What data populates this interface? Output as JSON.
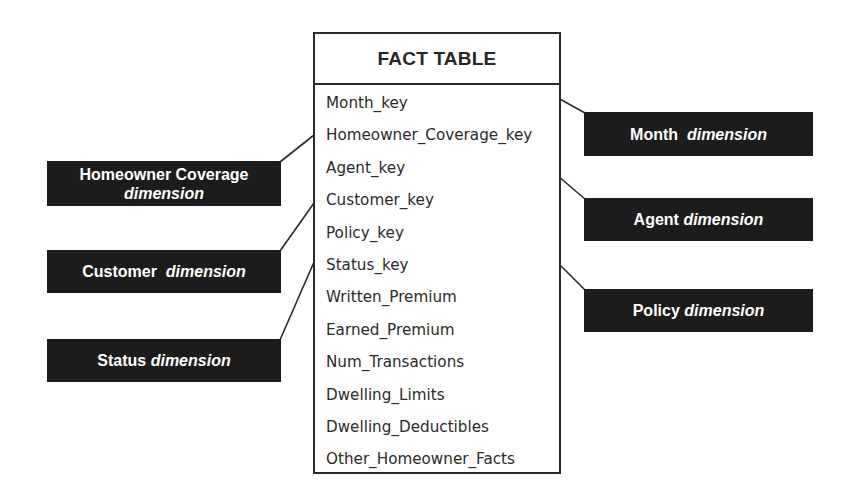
{
  "fact_table": {
    "title": "FACT TABLE",
    "fields": [
      "Month_key",
      "Homeowner_Coverage_key",
      "Agent_key",
      "Customer_key",
      "Policy_key",
      "Status_key",
      "Written_Premium",
      "Earned_Premium",
      "Num_Transactions",
      "Dwelling_Limits",
      "Dwelling_Deductibles",
      "Other_Homeowner_Facts"
    ]
  },
  "dimensions": {
    "left": [
      {
        "name": "Homeowner Coverage",
        "suffix": "dimension",
        "links_to": "Homeowner_Coverage_key"
      },
      {
        "name": "Customer",
        "suffix": "dimension",
        "links_to": "Customer_key"
      },
      {
        "name": "Status",
        "suffix": "dimension",
        "links_to": "Status_key"
      }
    ],
    "right": [
      {
        "name": "Month",
        "suffix": "dimension",
        "links_to": "Month_key"
      },
      {
        "name": "Agent",
        "suffix": "dimension",
        "links_to": "Agent_key"
      },
      {
        "name": "Policy",
        "suffix": "dimension",
        "links_to": "Policy_key"
      }
    ]
  },
  "colors": {
    "dimension_fill": "#1c1c1c",
    "dimension_text": "#ffffff",
    "table_border": "#2a2a2a",
    "table_text": "#2a2a2a"
  }
}
